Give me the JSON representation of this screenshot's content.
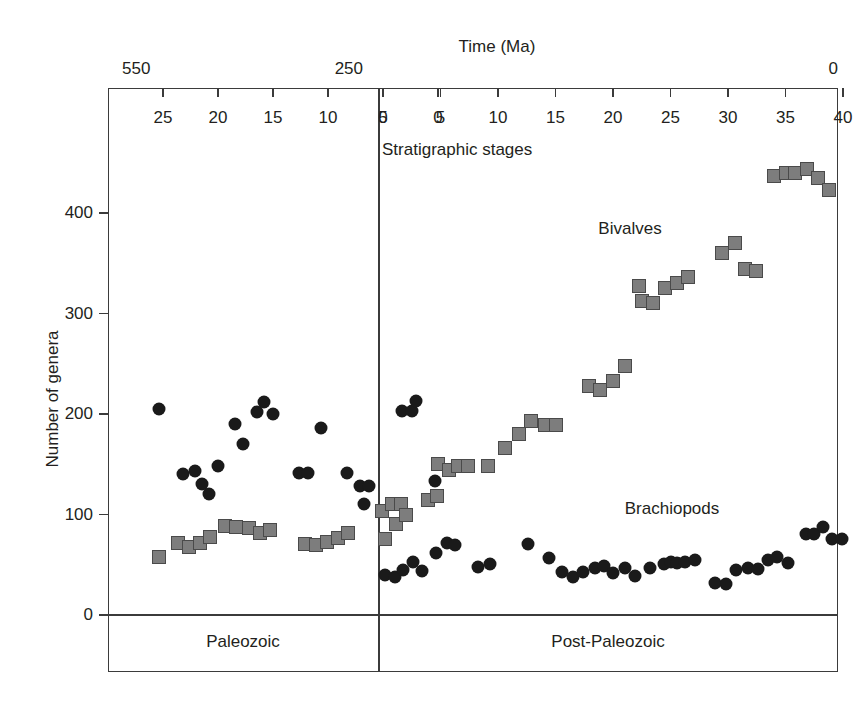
{
  "chart_data": {
    "type": "scatter",
    "title": "Time (Ma)",
    "xlabel": "Stratigraphic stages",
    "ylabel": "Number of genera",
    "ylim": [
      0,
      460
    ],
    "yticks": [
      0,
      100,
      200,
      300,
      400
    ],
    "ytick_labels": [
      "0",
      "100",
      "200",
      "300",
      "400"
    ],
    "grid": false,
    "legend_position": "inline-annotations",
    "time_axis": {
      "label": "Time (Ma)",
      "left_end": "550",
      "middle": "250",
      "right_end": "0"
    },
    "panels": [
      {
        "name": "Paleozoic",
        "label": "Paleozoic",
        "stage_axis_direction": "descending",
        "xticks": [
          25,
          20,
          15,
          10,
          5,
          0
        ],
        "xtick_labels": [
          "25",
          "20",
          "15",
          "10",
          "5",
          "0"
        ],
        "series": [
          {
            "name": "Brachiopods",
            "marker": "circle",
            "color": "#1a1a1a",
            "points": [
              {
                "stage": 25.4,
                "value": 205
              },
              {
                "stage": 23.2,
                "value": 140
              },
              {
                "stage": 22.1,
                "value": 143
              },
              {
                "stage": 21.5,
                "value": 130
              },
              {
                "stage": 20.8,
                "value": 120
              },
              {
                "stage": 20.0,
                "value": 148
              },
              {
                "stage": 18.5,
                "value": 190
              },
              {
                "stage": 17.7,
                "value": 170
              },
              {
                "stage": 16.5,
                "value": 202
              },
              {
                "stage": 15.8,
                "value": 212
              },
              {
                "stage": 15.0,
                "value": 200
              },
              {
                "stage": 12.6,
                "value": 141
              },
              {
                "stage": 11.8,
                "value": 141
              },
              {
                "stage": 10.6,
                "value": 186
              },
              {
                "stage": 8.3,
                "value": 141
              },
              {
                "stage": 7.1,
                "value": 128
              },
              {
                "stage": 6.3,
                "value": 128
              },
              {
                "stage": 6.7,
                "value": 110
              },
              {
                "stage": 3.3,
                "value": 203
              },
              {
                "stage": 2.4,
                "value": 203
              },
              {
                "stage": 2.0,
                "value": 213
              },
              {
                "stage": 0.3,
                "value": 133
              }
            ]
          },
          {
            "name": "Bivalves",
            "marker": "square",
            "color": "#7d7d7d",
            "points": [
              {
                "stage": 25.4,
                "value": 58
              },
              {
                "stage": 23.6,
                "value": 72
              },
              {
                "stage": 22.6,
                "value": 68
              },
              {
                "stage": 21.6,
                "value": 72
              },
              {
                "stage": 20.7,
                "value": 78
              },
              {
                "stage": 19.4,
                "value": 89
              },
              {
                "stage": 18.4,
                "value": 88
              },
              {
                "stage": 17.2,
                "value": 87
              },
              {
                "stage": 16.2,
                "value": 82
              },
              {
                "stage": 15.3,
                "value": 85
              },
              {
                "stage": 12.1,
                "value": 71
              },
              {
                "stage": 11.1,
                "value": 70
              },
              {
                "stage": 10.1,
                "value": 73
              },
              {
                "stage": 9.1,
                "value": 77
              },
              {
                "stage": 8.2,
                "value": 82
              },
              {
                "stage": 5.1,
                "value": 103
              },
              {
                "stage": 4.2,
                "value": 110
              },
              {
                "stage": 3.4,
                "value": 110
              },
              {
                "stage": 0.9,
                "value": 114
              },
              {
                "stage": 0.1,
                "value": 118
              }
            ]
          }
        ]
      },
      {
        "name": "Post-Paleozoic",
        "label": "Post-Paleozoic",
        "stage_axis_direction": "ascending",
        "xticks": [
          0,
          5,
          10,
          15,
          20,
          25,
          30,
          35,
          40
        ],
        "xtick_labels": [
          "0",
          "5",
          "10",
          "15",
          "20",
          "25",
          "30",
          "35",
          "40"
        ],
        "series": [
          {
            "name": "Brachiopods",
            "marker": "circle",
            "color": "#1a1a1a",
            "points": [
              {
                "stage": 0.2,
                "value": 40
              },
              {
                "stage": 1.0,
                "value": 38
              },
              {
                "stage": 1.7,
                "value": 45
              },
              {
                "stage": 2.6,
                "value": 53
              },
              {
                "stage": 3.4,
                "value": 44
              },
              {
                "stage": 4.6,
                "value": 62
              },
              {
                "stage": 5.6,
                "value": 72
              },
              {
                "stage": 6.3,
                "value": 70
              },
              {
                "stage": 8.3,
                "value": 48
              },
              {
                "stage": 9.3,
                "value": 51
              },
              {
                "stage": 12.6,
                "value": 71
              },
              {
                "stage": 14.4,
                "value": 57
              },
              {
                "stage": 15.6,
                "value": 43
              },
              {
                "stage": 16.5,
                "value": 38
              },
              {
                "stage": 17.4,
                "value": 43
              },
              {
                "stage": 18.4,
                "value": 47
              },
              {
                "stage": 19.2,
                "value": 49
              },
              {
                "stage": 20.0,
                "value": 42
              },
              {
                "stage": 21.0,
                "value": 47
              },
              {
                "stage": 21.9,
                "value": 39
              },
              {
                "stage": 23.2,
                "value": 47
              },
              {
                "stage": 24.4,
                "value": 51
              },
              {
                "stage": 25.0,
                "value": 53
              },
              {
                "stage": 25.6,
                "value": 52
              },
              {
                "stage": 26.3,
                "value": 53
              },
              {
                "stage": 27.1,
                "value": 55
              },
              {
                "stage": 28.9,
                "value": 32
              },
              {
                "stage": 29.8,
                "value": 31
              },
              {
                "stage": 30.7,
                "value": 45
              },
              {
                "stage": 31.7,
                "value": 47
              },
              {
                "stage": 32.6,
                "value": 46
              },
              {
                "stage": 33.5,
                "value": 55
              },
              {
                "stage": 34.3,
                "value": 58
              },
              {
                "stage": 35.2,
                "value": 52
              },
              {
                "stage": 36.8,
                "value": 81
              },
              {
                "stage": 37.5,
                "value": 81
              },
              {
                "stage": 38.3,
                "value": 88
              },
              {
                "stage": 39.0,
                "value": 76
              },
              {
                "stage": 39.9,
                "value": 76
              }
            ]
          },
          {
            "name": "Bivalves",
            "marker": "square",
            "color": "#7d7d7d",
            "points": [
              {
                "stage": 0.2,
                "value": 76
              },
              {
                "stage": 1.1,
                "value": 91
              },
              {
                "stage": 2.0,
                "value": 100
              },
              {
                "stage": 4.8,
                "value": 150
              },
              {
                "stage": 5.7,
                "value": 144
              },
              {
                "stage": 6.5,
                "value": 148
              },
              {
                "stage": 7.4,
                "value": 148
              },
              {
                "stage": 9.1,
                "value": 148
              },
              {
                "stage": 10.6,
                "value": 166
              },
              {
                "stage": 11.8,
                "value": 180
              },
              {
                "stage": 12.9,
                "value": 193
              },
              {
                "stage": 14.1,
                "value": 189
              },
              {
                "stage": 15.0,
                "value": 189
              },
              {
                "stage": 17.9,
                "value": 228
              },
              {
                "stage": 18.9,
                "value": 224
              },
              {
                "stage": 20.0,
                "value": 233
              },
              {
                "stage": 21.0,
                "value": 248
              },
              {
                "stage": 22.3,
                "value": 327
              },
              {
                "stage": 22.5,
                "value": 312
              },
              {
                "stage": 23.5,
                "value": 310
              },
              {
                "stage": 24.5,
                "value": 325
              },
              {
                "stage": 25.6,
                "value": 330
              },
              {
                "stage": 26.5,
                "value": 336
              },
              {
                "stage": 29.5,
                "value": 360
              },
              {
                "stage": 30.6,
                "value": 370
              },
              {
                "stage": 31.5,
                "value": 344
              },
              {
                "stage": 32.4,
                "value": 342
              },
              {
                "stage": 34.0,
                "value": 437
              },
              {
                "stage": 35.0,
                "value": 440
              },
              {
                "stage": 35.8,
                "value": 440
              },
              {
                "stage": 36.9,
                "value": 444
              },
              {
                "stage": 37.8,
                "value": 435
              },
              {
                "stage": 38.8,
                "value": 423
              }
            ]
          }
        ]
      }
    ],
    "annotations": [
      {
        "text": "Bivalves",
        "panel": "Post-Paleozoic"
      },
      {
        "text": "Brachiopods",
        "panel": "Post-Paleozoic"
      },
      {
        "text": "Stratigraphic stages",
        "panel": "Post-Paleozoic"
      }
    ]
  },
  "colors": {
    "brachiopod_marker": "#1a1a1a",
    "bivalve_marker": "#7d7d7d",
    "axis": "#3b3b3b",
    "text": "#231f20",
    "background": "#ffffff"
  }
}
